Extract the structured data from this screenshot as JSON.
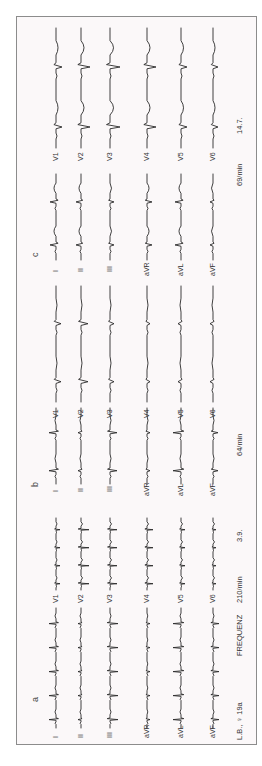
{
  "figure": {
    "orientation": "rotated-90-ccw",
    "colors": {
      "trace": "#2a2a2a",
      "paper": "#fbf8f9",
      "border": "#8c8c8c"
    },
    "panels": [
      {
        "id": "a",
        "label": "a",
        "limb_leads": [
          "I",
          "II",
          "III",
          "aVR",
          "aVL",
          "aVF"
        ],
        "chest_leads": [
          "V1",
          "V2",
          "V3",
          "V4",
          "V5",
          "V6"
        ],
        "rate_label": "FREQUENZ",
        "rate": "210/min",
        "date": "3.9.",
        "rhythm": "tachycardia"
      },
      {
        "id": "b",
        "label": "b",
        "limb_leads": [
          "I",
          "II",
          "III",
          "aVR",
          "aVL",
          "aVF"
        ],
        "chest_leads": [
          "V1",
          "V2",
          "V3",
          "V4",
          "V5",
          "V6"
        ],
        "rate": "64/min"
      },
      {
        "id": "c",
        "label": "c",
        "limb_leads": [
          "I",
          "II",
          "III",
          "aVR",
          "aVL",
          "aVF"
        ],
        "chest_leads": [
          "V1",
          "V2",
          "V3",
          "V4",
          "V5",
          "V6"
        ],
        "rate": "69/min",
        "date": "14.7."
      }
    ],
    "patient": "L.B., ♀ 19a"
  }
}
